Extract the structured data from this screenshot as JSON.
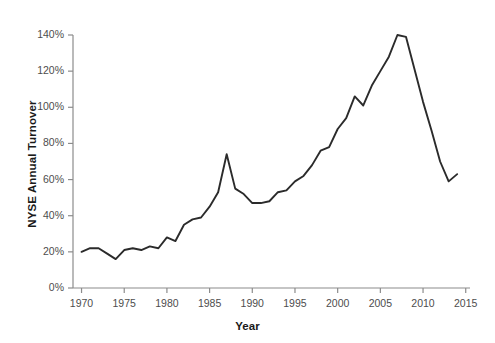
{
  "chart_data": {
    "type": "line",
    "title": "",
    "xlabel": "Year",
    "ylabel": "NYSE Annual Turnover",
    "xlim": [
      1969,
      2015.5
    ],
    "ylim": [
      0,
      140
    ],
    "grid": false,
    "legend": "none",
    "line_color": "#2b2b2b",
    "axis_color": "#8c8c8c",
    "x_ticks": [
      1970,
      1975,
      1980,
      1985,
      1990,
      1995,
      2000,
      2005,
      2010,
      2015
    ],
    "x_tick_labels": [
      "1970",
      "1975",
      "1980",
      "1985",
      "1990",
      "1995",
      "2000",
      "2005",
      "2010",
      "2015"
    ],
    "y_ticks": [
      0,
      20,
      40,
      60,
      80,
      100,
      120,
      140
    ],
    "y_tick_labels": [
      "0%",
      "20%",
      "40%",
      "60%",
      "80%",
      "100%",
      "120%",
      "140%"
    ],
    "series": [
      {
        "name": "NYSE Annual Turnover",
        "x": [
          1970,
          1971,
          1972,
          1973,
          1974,
          1975,
          1976,
          1977,
          1978,
          1979,
          1980,
          1981,
          1982,
          1983,
          1984,
          1985,
          1986,
          1987,
          1988,
          1989,
          1990,
          1991,
          1992,
          1993,
          1994,
          1995,
          1996,
          1997,
          1998,
          1999,
          2000,
          2001,
          2002,
          2003,
          2004,
          2005,
          2006,
          2007,
          2008,
          2009,
          2010,
          2011,
          2012,
          2013,
          2014
        ],
        "values": [
          20,
          22,
          22,
          19,
          16,
          21,
          22,
          21,
          23,
          22,
          28,
          26,
          35,
          38,
          39,
          45,
          53,
          74,
          55,
          52,
          47,
          47,
          48,
          53,
          54,
          59,
          62,
          68,
          76,
          78,
          88,
          94,
          106,
          101,
          112,
          120,
          128,
          140,
          139,
          121,
          103,
          87,
          70,
          59,
          63
        ]
      }
    ],
    "annotations": []
  },
  "axis": {
    "y_label": "NYSE Annual Turnover",
    "x_label": "Year"
  }
}
